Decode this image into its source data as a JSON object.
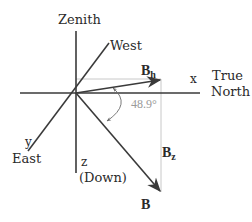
{
  "diagram": {
    "axes": {
      "zenith_label": "Zenith",
      "west_label": "West",
      "x_label": "x",
      "true_label": "True",
      "north_label": "North",
      "y_label": "y",
      "east_label": "East",
      "z_label": "z",
      "down_label": "(Down)"
    },
    "vectors": {
      "bh_main": "B",
      "bh_sub": "h",
      "bz_main": "B",
      "bz_sub": "z",
      "b_label": "B"
    },
    "angle": {
      "value_label": "48.9°"
    },
    "colors": {
      "axis": "#3a3a3a",
      "vector": "#3a3a3a",
      "guide": "#c8c8c8",
      "angle_text": "#9a9a9a"
    }
  }
}
